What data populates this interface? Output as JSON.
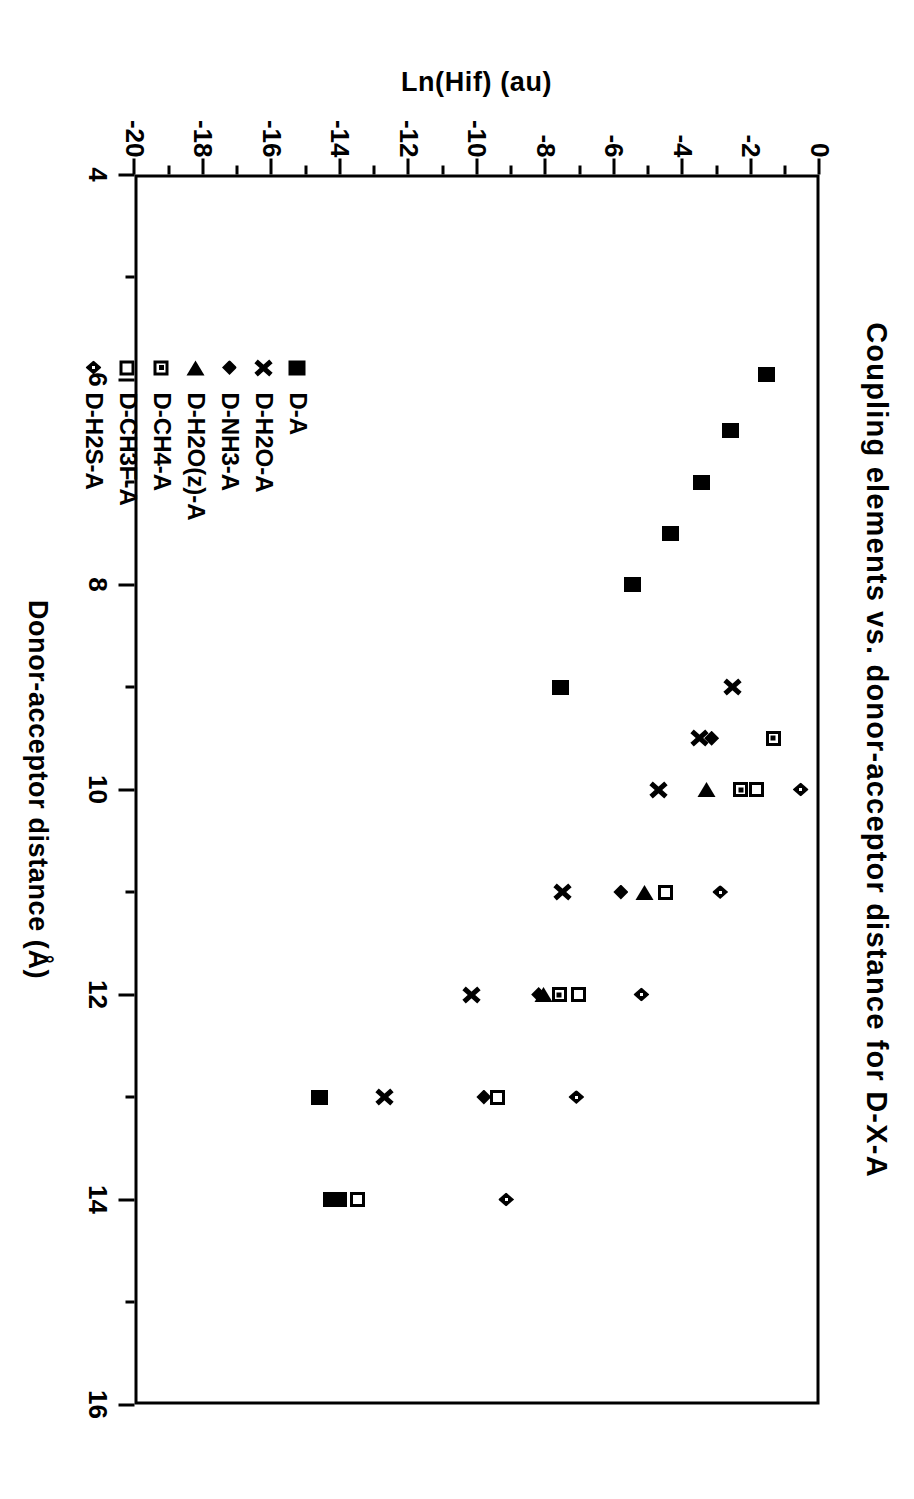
{
  "chart_data": {
    "type": "scatter",
    "title": "Coupling  elements  vs.  donor-acceptor  distance  for  D-X-A",
    "xlabel": "Donor-acceptor  distance  (Å)",
    "ylabel": "Ln(Hif)  (au)",
    "xlim": [
      4,
      16
    ],
    "ylim": [
      -20,
      0
    ],
    "xticks": [
      "4",
      "6",
      "8",
      "10",
      "12",
      "14",
      "16"
    ],
    "yticks": [
      "0",
      "-2",
      "-4",
      "-6",
      "-8",
      "-10",
      "-12",
      "-14",
      "-16",
      "-18",
      "-20"
    ],
    "xtick_values": [
      4,
      6,
      8,
      10,
      12,
      14,
      16
    ],
    "ytick_values": [
      0,
      -2,
      -4,
      -6,
      -8,
      -10,
      -12,
      -14,
      -16,
      -18,
      -20
    ],
    "minor_ticks": true,
    "grid": false,
    "legend_position": "inside-lower-left",
    "series": [
      {
        "name": "D-A",
        "marker": "filled-square",
        "points": [
          {
            "x": 5.95,
            "y": -1.55
          },
          {
            "x": 6.5,
            "y": -2.6
          },
          {
            "x": 7.0,
            "y": -3.45
          },
          {
            "x": 7.5,
            "y": -4.35
          },
          {
            "x": 8.0,
            "y": -5.45
          },
          {
            "x": 9.0,
            "y": -7.55
          },
          {
            "x": 13.0,
            "y": -14.6
          },
          {
            "x": 14.0,
            "y": -14.05
          },
          {
            "x": 14.0,
            "y": -14.25
          }
        ]
      },
      {
        "name": "D-H2O-A",
        "marker": "cross-x",
        "points": [
          {
            "x": 9.0,
            "y": -2.55
          },
          {
            "x": 9.5,
            "y": -3.5
          },
          {
            "x": 10.0,
            "y": -4.7
          },
          {
            "x": 11.0,
            "y": -7.5
          },
          {
            "x": 12.0,
            "y": -10.15
          },
          {
            "x": 13.0,
            "y": -12.7
          }
        ]
      },
      {
        "name": "D-NH3-A",
        "marker": "filled-diamond",
        "points": [
          {
            "x": 9.5,
            "y": -3.15
          },
          {
            "x": 11.0,
            "y": -5.8
          },
          {
            "x": 12.0,
            "y": -8.2
          },
          {
            "x": 13.0,
            "y": -9.8
          }
        ]
      },
      {
        "name": "D-H2O(z)-A",
        "marker": "filled-triangle-left",
        "points": [
          {
            "x": 10.0,
            "y": -3.3
          },
          {
            "x": 11.0,
            "y": -5.1
          },
          {
            "x": 12.0,
            "y": -8.05
          }
        ]
      },
      {
        "name": "D-CH4-A",
        "marker": "dotted-square",
        "points": [
          {
            "x": 9.5,
            "y": -1.35
          },
          {
            "x": 10.0,
            "y": -2.3
          },
          {
            "x": 12.0,
            "y": -7.6
          }
        ]
      },
      {
        "name": "D-CH3F-A",
        "marker": "open-square",
        "points": [
          {
            "x": 10.0,
            "y": -1.85
          },
          {
            "x": 11.0,
            "y": -4.5
          },
          {
            "x": 12.0,
            "y": -7.05
          },
          {
            "x": 13.0,
            "y": -9.4
          },
          {
            "x": 14.0,
            "y": -13.5
          }
        ]
      },
      {
        "name": "D-H2S-A",
        "marker": "small-diamond",
        "points": [
          {
            "x": 10.0,
            "y": -0.55
          },
          {
            "x": 11.0,
            "y": -2.9
          },
          {
            "x": 12.0,
            "y": -5.2
          },
          {
            "x": 13.0,
            "y": -7.1
          },
          {
            "x": 14.0,
            "y": -9.15
          }
        ]
      }
    ]
  },
  "legend": {
    "items": [
      {
        "label": "D-A",
        "marker": "filled-square"
      },
      {
        "label": "D-H2O-A",
        "marker": "cross-x"
      },
      {
        "label": "D-NH3-A",
        "marker": "filled-diamond"
      },
      {
        "label": "D-H2O(z)-A",
        "marker": "filled-triangle-left"
      },
      {
        "label": "D-CH4-A",
        "marker": "dotted-square"
      },
      {
        "label": "D-CH3F-A",
        "marker": "open-square"
      },
      {
        "label": "D-H2S-A",
        "marker": "small-diamond"
      }
    ]
  },
  "colors": {
    "ink": "#000000",
    "paper": "#ffffff"
  }
}
